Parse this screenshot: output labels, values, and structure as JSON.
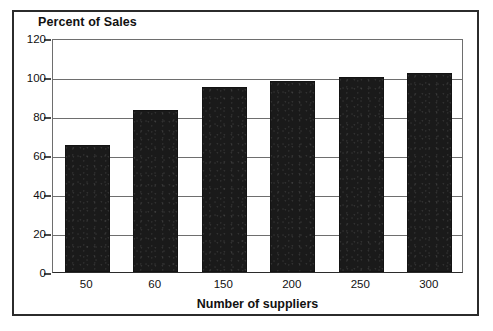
{
  "chart_data": {
    "type": "bar",
    "title": "Percent of Sales",
    "xlabel": "Number of suppliers",
    "ylabel": "",
    "categories": [
      "50",
      "60",
      "150",
      "200",
      "250",
      "300"
    ],
    "values": [
      65,
      83,
      95,
      98,
      100,
      102
    ],
    "ylim": [
      0,
      120
    ],
    "yticks": [
      0,
      20,
      40,
      60,
      80,
      100,
      120
    ],
    "ytick_labels": [
      "0",
      "20",
      "40",
      "60",
      "80",
      "100",
      "120"
    ],
    "grid": true,
    "legend": false,
    "bar_color": "#1a1a1a",
    "axis_color": "#6e6e6e",
    "frame_color": "#2b2b2b",
    "background": "#ffffff"
  }
}
